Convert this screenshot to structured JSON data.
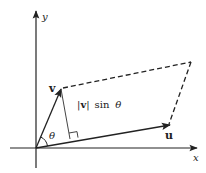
{
  "diagram": {
    "title": "",
    "axes": {
      "x_label": "x",
      "y_label": "y"
    },
    "vectors": {
      "v_label": "v",
      "u_label": "u"
    },
    "angle_label": "θ",
    "height_label": "|v| sin θ",
    "height_label_parts": {
      "open_bar": "|",
      "vec": "v",
      "close_bar": "|",
      "func": "sin",
      "angle": "θ"
    },
    "colors": {
      "line": "#222222",
      "background": "#ffffff"
    }
  }
}
